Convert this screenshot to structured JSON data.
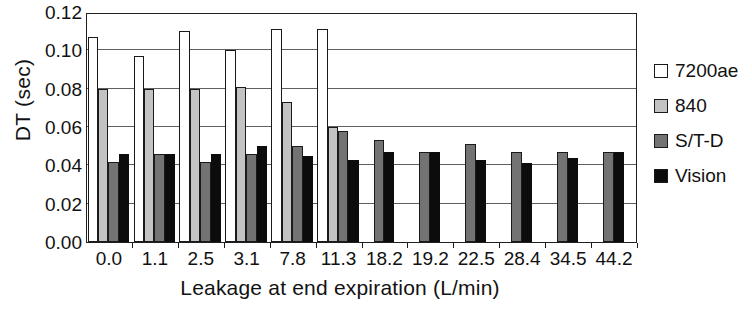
{
  "chart_data": {
    "type": "bar",
    "title": "",
    "xlabel": "Leakage at end expiration  (L/min)",
    "ylabel": "DT (sec)",
    "categories": [
      "0.0",
      "1.1",
      "2.5",
      "3.1",
      "7.8",
      "11.3",
      "18.2",
      "19.2",
      "22.5",
      "28.4",
      "34.5",
      "44.2"
    ],
    "ylim": [
      0.0,
      0.12
    ],
    "ytick_labels": [
      "0.00",
      "0.02",
      "0.04",
      "0.06",
      "0.08",
      "0.10",
      "0.12"
    ],
    "ytick_values": [
      0.0,
      0.02,
      0.04,
      0.06,
      0.08,
      0.1,
      0.12
    ],
    "grid": "horizontal",
    "legend_position": "right",
    "series": [
      {
        "name": "7200ae",
        "color": "#ffffff",
        "values": [
          0.107,
          0.097,
          0.11,
          0.1,
          0.111,
          0.111,
          null,
          null,
          null,
          null,
          null,
          null
        ]
      },
      {
        "name": "840",
        "color": "#c3c3c3",
        "values": [
          0.08,
          0.08,
          0.08,
          0.081,
          0.073,
          0.06,
          null,
          null,
          null,
          null,
          null,
          null
        ]
      },
      {
        "name": "S/T-D",
        "color": "#737373",
        "values": [
          0.042,
          0.046,
          0.042,
          0.046,
          0.05,
          0.058,
          0.053,
          0.047,
          0.051,
          0.047,
          0.047,
          0.047
        ]
      },
      {
        "name": "Vision",
        "color": "#0c0c0c",
        "values": [
          0.046,
          0.046,
          0.046,
          0.05,
          0.045,
          0.043,
          0.047,
          0.047,
          0.043,
          0.041,
          0.044,
          0.047
        ]
      }
    ]
  },
  "legend": {
    "items": [
      {
        "label": "7200ae",
        "swatch_class": "sw-7200ae"
      },
      {
        "label": "840",
        "swatch_class": "sw-840"
      },
      {
        "label": "S/T-D",
        "swatch_class": "sw-std"
      },
      {
        "label": "Vision",
        "swatch_class": "sw-vision"
      }
    ]
  }
}
